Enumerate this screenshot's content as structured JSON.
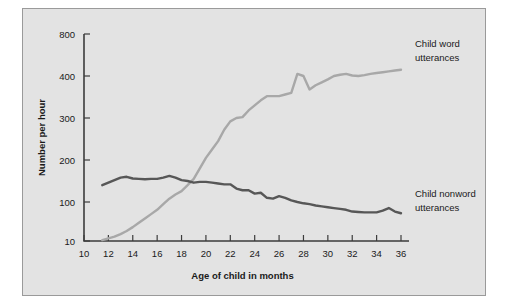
{
  "figure": {
    "background_color": "#e3e3e3",
    "page_color": "#ffffff",
    "frame_color": "#9a9a9a"
  },
  "chart_data": {
    "type": "line",
    "title": "",
    "xlabel": "Age of child in months",
    "ylabel": "Number per hour",
    "xlim": [
      10,
      36
    ],
    "ylim_labels": [
      "10",
      "100",
      "200",
      "300",
      "400",
      "800"
    ],
    "x_ticks": [
      10,
      12,
      14,
      16,
      18,
      20,
      22,
      24,
      26,
      28,
      30,
      32,
      34,
      36
    ],
    "y_ticks": [
      10,
      100,
      200,
      300,
      400,
      800
    ],
    "grid": false,
    "legend_position": "inline-right",
    "series": [
      {
        "name": "Child word utterances",
        "color": "#a8a8a8",
        "label_lines": [
          "Child word",
          "utterances"
        ],
        "x": [
          11.5,
          12,
          12.5,
          13,
          13.5,
          14,
          14.5,
          15,
          15.5,
          16,
          16.5,
          17,
          17.5,
          18,
          18.5,
          19,
          19.5,
          20,
          20.5,
          21,
          21.5,
          22,
          22.5,
          23,
          23.5,
          24,
          24.5,
          25,
          25.5,
          26,
          26.5,
          27,
          27.5,
          28,
          28.5,
          29,
          29.5,
          30,
          30.5,
          31,
          31.5,
          32,
          32.5,
          33,
          33.5,
          34,
          34.5,
          35,
          35.5,
          36
        ],
        "y": [
          12,
          16,
          20,
          26,
          33,
          42,
          52,
          62,
          72,
          82,
          95,
          108,
          118,
          126,
          140,
          155,
          180,
          205,
          225,
          245,
          272,
          292,
          300,
          302,
          318,
          330,
          342,
          352,
          352,
          352,
          356,
          360,
          420,
          400,
          368,
          378,
          385,
          392,
          400,
          412,
          420,
          405,
          400,
          408,
          420,
          428,
          436,
          444,
          452,
          460
        ]
      },
      {
        "name": "Child nonword utterances",
        "color": "#575757",
        "label_lines": [
          "Child nonword",
          "utterances"
        ],
        "x": [
          11.5,
          12,
          12.5,
          13,
          13.5,
          14,
          14.5,
          15,
          15.5,
          16,
          16.5,
          17,
          17.5,
          18,
          18.5,
          19,
          19.5,
          20,
          20.5,
          21,
          21.5,
          22,
          22.5,
          23,
          23.5,
          24,
          24.5,
          25,
          25.5,
          26,
          26.5,
          27,
          27.5,
          28,
          28.5,
          29,
          29.5,
          30,
          30.5,
          31,
          31.5,
          32,
          32.5,
          33,
          33.5,
          34,
          34.5,
          35,
          35.5,
          36
        ],
        "y": [
          140,
          146,
          152,
          158,
          160,
          156,
          155,
          154,
          155,
          155,
          158,
          162,
          158,
          152,
          150,
          146,
          148,
          148,
          146,
          144,
          142,
          142,
          132,
          128,
          128,
          120,
          122,
          110,
          108,
          114,
          110,
          104,
          100,
          97,
          95,
          92,
          90,
          88,
          86,
          84,
          82,
          78,
          77,
          76,
          76,
          76,
          80,
          86,
          78,
          74
        ]
      }
    ]
  }
}
